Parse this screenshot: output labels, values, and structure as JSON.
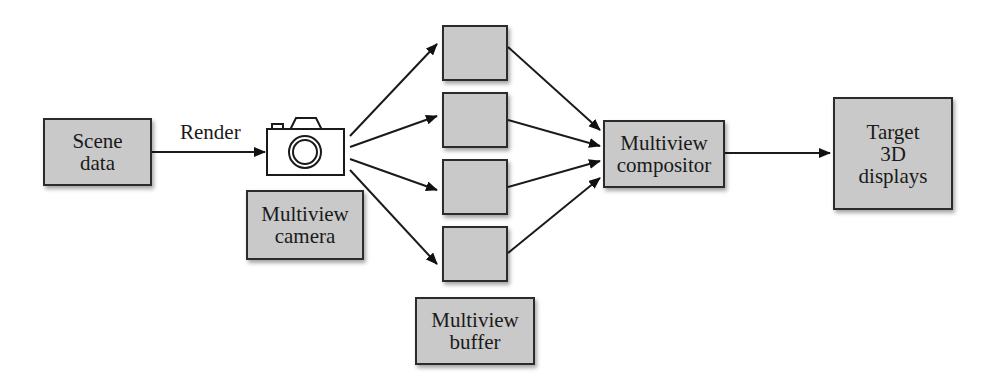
{
  "diagram": {
    "nodes": {
      "scene_data": "Scene\ndata",
      "multiview_camera": "Multiview\ncamera",
      "buffer_label": "Multiview\nbuffer",
      "compositor": "Multiview\ncompositor",
      "target": "Target\n3D\ndisplays"
    },
    "edge_labels": {
      "render": "Render"
    },
    "buffer_views": [
      "",
      "",
      "",
      ""
    ],
    "icons": {
      "camera": "camera-icon"
    },
    "colors": {
      "box_fill": "#c9c9c9",
      "stroke": "#2b2b2b",
      "background": "#ffffff"
    }
  }
}
